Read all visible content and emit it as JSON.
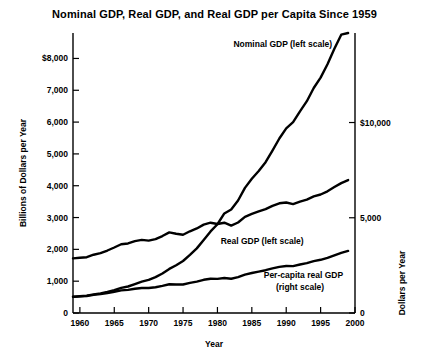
{
  "chart_data": {
    "type": "line",
    "title": "Nominal GDP, Real GDP, and Real GDP per Capita Since 1959",
    "xlabel": "Year",
    "ylabel": "Billions of Dollars per Year",
    "ylabel_right": "Dollars per Year",
    "xlim": [
      1959,
      2000
    ],
    "ylim": [
      0,
      8800
    ],
    "ylim_right": [
      0,
      14700
    ],
    "grid": false,
    "legend_position": "inline-annotations",
    "xticks": [
      1960,
      1965,
      1970,
      1975,
      1980,
      1985,
      1990,
      1995,
      2000
    ],
    "xtick_labels": [
      "1960",
      "1965",
      "1970",
      "1975",
      "1980",
      "1985",
      "1990",
      "1995",
      "2000"
    ],
    "yticks": [
      0,
      1000,
      2000,
      3000,
      4000,
      5000,
      6000,
      7000,
      8000
    ],
    "ytick_labels": [
      "0",
      "1,000",
      "2,000",
      "3,000",
      "4,000",
      "5,000",
      "6,000",
      "7,000",
      "$8,000"
    ],
    "yticks_right": [
      0,
      5000,
      10000
    ],
    "ytick_labels_right": [
      "0",
      "5,000",
      "$10,000"
    ],
    "annotations": [
      {
        "text": "Nominal GDP (left scale)",
        "x": 1989.5,
        "y": 8350
      },
      {
        "text": "Real GDP (left scale)",
        "x": 1986.5,
        "y": 2180
      },
      {
        "text": "Per-capita real GDP",
        "x": 1992.5,
        "y": 1100
      },
      {
        "text": "(right scale)",
        "x": 1992.0,
        "y": 720
      }
    ],
    "x": [
      1959,
      1960,
      1961,
      1962,
      1963,
      1964,
      1965,
      1966,
      1967,
      1968,
      1969,
      1970,
      1971,
      1972,
      1973,
      1974,
      1975,
      1976,
      1977,
      1978,
      1979,
      1980,
      1981,
      1982,
      1983,
      1984,
      1985,
      1986,
      1987,
      1988,
      1989,
      1990,
      1991,
      1992,
      1993,
      1994,
      1995,
      1996,
      1997,
      1998,
      1999
    ],
    "series": [
      {
        "name": "Nominal GDP (left scale)",
        "scale": "left",
        "unit": "Billions of Dollars per Year",
        "values": [
          507,
          527,
          545,
          586,
          618,
          664,
          719,
          788,
          833,
          910,
          985,
          1039,
          1128,
          1240,
          1386,
          1501,
          1635,
          1824,
          2031,
          2295,
          2563,
          2790,
          3128,
          3255,
          3537,
          3933,
          4220,
          4463,
          4740,
          5104,
          5484,
          5803,
          5996,
          6338,
          6657,
          7072,
          7398,
          7817,
          8304,
          8747,
          8800
        ]
      },
      {
        "name": "Real GDP (left scale)",
        "scale": "left",
        "unit": "Billions of Dollars per Year",
        "values": [
          510,
          522,
          536,
          568,
          592,
          627,
          667,
          710,
          727,
          761,
          784,
          784,
          811,
          854,
          903,
          898,
          896,
          945,
          988,
          1043,
          1076,
          1073,
          1100,
          1077,
          1126,
          1208,
          1258,
          1301,
          1345,
          1400,
          1450,
          1477,
          1473,
          1523,
          1566,
          1630,
          1672,
          1735,
          1812,
          1890,
          1950
        ]
      },
      {
        "name": "Per-capita real GDP (right scale)",
        "scale": "right",
        "unit": "Dollars per Year",
        "values": [
          2870,
          2900,
          2930,
          3060,
          3140,
          3280,
          3440,
          3610,
          3650,
          3770,
          3840,
          3800,
          3880,
          4040,
          4230,
          4160,
          4110,
          4290,
          4440,
          4640,
          4740,
          4670,
          4740,
          4590,
          4750,
          5050,
          5200,
          5330,
          5450,
          5620,
          5760,
          5800,
          5720,
          5850,
          5950,
          6120,
          6220,
          6390,
          6610,
          6820,
          6980
        ]
      }
    ]
  }
}
